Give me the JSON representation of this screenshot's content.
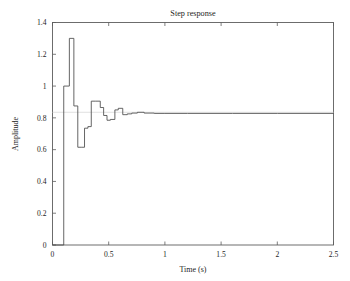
{
  "chart_data": {
    "type": "line",
    "title": "Step response",
    "xlabel": "Time (s)",
    "ylabel": "Amplitude",
    "xlim": [
      0,
      2.5
    ],
    "ylim": [
      0,
      1.4
    ],
    "xticks": [
      0,
      0.5,
      1,
      1.5,
      2,
      2.5
    ],
    "xticklabels": [
      "0",
      "0.5",
      "1",
      "1.5",
      "2",
      "2.5"
    ],
    "yticks": [
      0,
      0.2,
      0.4,
      0.6,
      0.8,
      1,
      1.2,
      1.4
    ],
    "yticklabels": [
      "0",
      "0.2",
      "0.4",
      "0.6",
      "0.8",
      "1",
      "1.2",
      "1.4"
    ],
    "grid": false,
    "legend": null,
    "line_color": "#4a4a4a",
    "reference_level": 0.835,
    "reference_color": "#d8d8d8",
    "step_style": "staircase",
    "series": [
      {
        "name": "Step response",
        "x": [
          0.0,
          0.1,
          0.1,
          0.15,
          0.15,
          0.19,
          0.19,
          0.225,
          0.225,
          0.255,
          0.255,
          0.285,
          0.285,
          0.315,
          0.315,
          0.345,
          0.345,
          0.385,
          0.385,
          0.425,
          0.425,
          0.455,
          0.455,
          0.485,
          0.485,
          0.515,
          0.515,
          0.555,
          0.555,
          0.585,
          0.585,
          0.625,
          0.625,
          0.665,
          0.665,
          0.705,
          0.705,
          0.755,
          0.755,
          0.815,
          0.815,
          0.905,
          0.905,
          1.0,
          1.2,
          1.6,
          2.0,
          2.5
        ],
        "y": [
          0.0,
          0.0,
          1.0,
          1.0,
          1.3,
          1.3,
          0.875,
          0.875,
          0.615,
          0.615,
          0.615,
          0.615,
          0.735,
          0.735,
          0.745,
          0.745,
          0.905,
          0.905,
          0.905,
          0.905,
          0.865,
          0.865,
          0.815,
          0.815,
          0.785,
          0.785,
          0.79,
          0.79,
          0.85,
          0.85,
          0.86,
          0.86,
          0.82,
          0.82,
          0.825,
          0.825,
          0.83,
          0.83,
          0.835,
          0.835,
          0.83,
          0.83,
          0.828,
          0.828,
          0.828,
          0.828,
          0.828,
          0.828
        ]
      }
    ],
    "annotations": {
      "peak_value": 1.3,
      "peak_time": 0.16,
      "min_value": 0.615,
      "min_time": 0.24,
      "steady_state": 0.828,
      "step_onset_time": 0.1
    }
  }
}
